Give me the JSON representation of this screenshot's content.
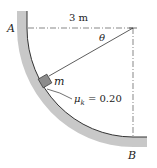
{
  "diagram": {
    "labels": {
      "point_a": "A",
      "point_b": "B",
      "radius": "3 m",
      "angle": "θ",
      "mass": "m",
      "friction": "μk = 0.20",
      "friction_symbol": "μ",
      "friction_sub": "k",
      "friction_value": "= 0.20"
    },
    "colors": {
      "surface_shade": "#9a9a9a",
      "block_fill": "#8c8c8c",
      "line": "#333333"
    }
  }
}
